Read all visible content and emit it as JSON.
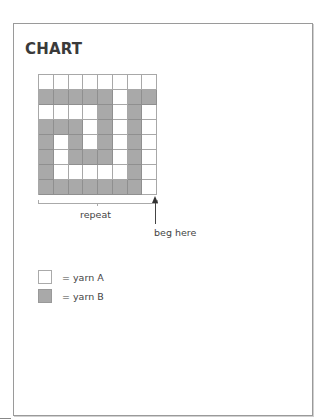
{
  "title": "CHART",
  "chart_data": {
    "type": "heatmap",
    "title": "CHART",
    "rows": 8,
    "columns": 8,
    "legend": [
      {
        "value": 0,
        "label": "yarn A",
        "color": "#ffffff"
      },
      {
        "value": 1,
        "label": "yarn B",
        "color": "#a9a9a9"
      }
    ],
    "grid": [
      [
        0,
        0,
        0,
        0,
        0,
        0,
        0,
        0
      ],
      [
        1,
        1,
        1,
        1,
        1,
        0,
        1,
        1
      ],
      [
        0,
        0,
        0,
        0,
        1,
        0,
        1,
        0
      ],
      [
        1,
        1,
        1,
        0,
        1,
        0,
        1,
        0
      ],
      [
        1,
        0,
        1,
        0,
        1,
        0,
        1,
        0
      ],
      [
        1,
        0,
        1,
        1,
        1,
        0,
        1,
        0
      ],
      [
        1,
        0,
        0,
        0,
        0,
        0,
        1,
        0
      ],
      [
        1,
        1,
        1,
        1,
        1,
        1,
        1,
        0
      ]
    ],
    "annotations": [
      "repeat",
      "beg here"
    ]
  },
  "labels": {
    "repeat": "repeat",
    "beg_here": "beg here"
  },
  "legend": [
    {
      "text": "= yarn A",
      "color": "#ffffff"
    },
    {
      "text": "= yarn B",
      "color": "#a9a9a9"
    }
  ],
  "colors": {
    "yarn_a": "#ffffff",
    "yarn_b": "#a9a9a9",
    "grid_line": "#a8a8a8"
  }
}
